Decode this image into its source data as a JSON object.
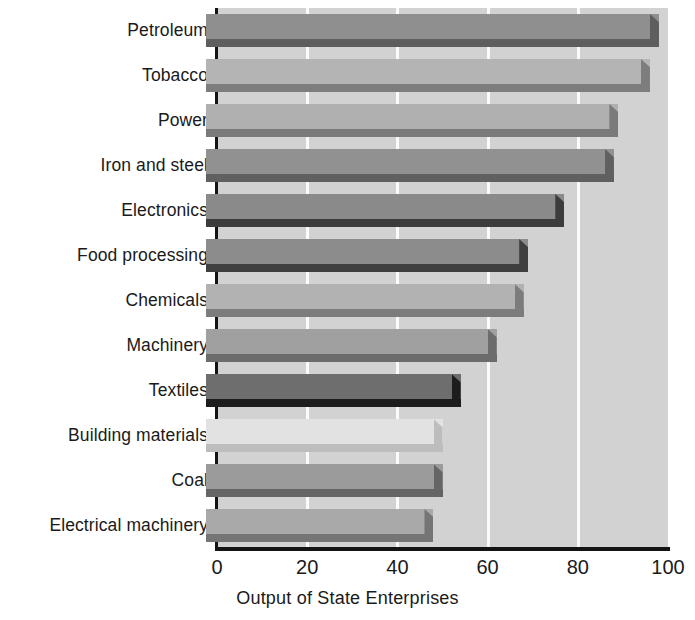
{
  "chart_data": {
    "type": "bar",
    "orientation": "horizontal",
    "title": "",
    "subtitle": "",
    "xlabel": "Output of State Enterprises",
    "ylabel": "",
    "xlim": [
      0,
      100
    ],
    "xticks": [
      0,
      20,
      40,
      60,
      80,
      100
    ],
    "xtick_labels": [
      "0",
      "20",
      "40",
      "60",
      "80",
      "100"
    ],
    "grid": true,
    "gridlines_at": [
      20,
      40,
      60,
      80
    ],
    "legend": "none",
    "categories": [
      "Petroleum",
      "Tobacco",
      "Power",
      "Iron and steel",
      "Electronics",
      "Food processing",
      "Chemicals",
      "Machinery",
      "Textiles",
      "Building materials",
      "Coal",
      "Electrical machinery"
    ],
    "values": [
      98,
      96,
      89,
      88,
      77,
      69,
      68,
      62,
      54,
      50,
      50,
      48
    ],
    "bar_colors": [
      "#8f8f8f",
      "#b4b4b4",
      "#b0b0b0",
      "#919191",
      "#8a8a8a",
      "#8c8c8c",
      "#b2b2b2",
      "#a0a0a0",
      "#6e6e6e",
      "#e2e2e2",
      "#9b9b9b",
      "#a9a9a9"
    ],
    "bar_shadow_colors": [
      "#5e5e5e",
      "#7d7d7d",
      "#7a7a7a",
      "#606060",
      "#3c3c3c",
      "#3f3f3f",
      "#7c7c7c",
      "#6c6c6c",
      "#1d1d1d",
      "#bdbdbd",
      "#656565",
      "#757575"
    ],
    "plot_background": "#d2d2d2",
    "gridline_color": "#fbfbfb",
    "axis_color": "#141414",
    "page_background": "#ffffff",
    "text_color": "#1a1a1a"
  }
}
